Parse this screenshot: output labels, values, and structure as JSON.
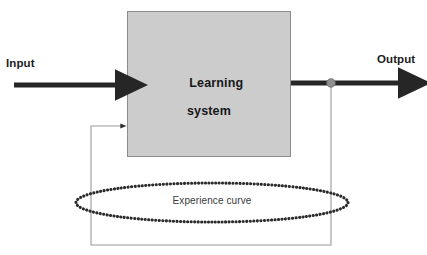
{
  "diagram": {
    "canvas": {
      "width": 427,
      "height": 255,
      "background": "#ffffff"
    },
    "colors": {
      "box_fill": "#cccccc",
      "box_stroke": "#8c8c8c",
      "arrow_dark": "#262626",
      "thin_line": "#9a9a9a",
      "node_fill": "#8f8f8f",
      "node_stroke": "#6e6e6e",
      "dotted_curve": "#2b2b2b",
      "text_dark": "#1c1c1c",
      "text_curve": "#3a3a3a"
    },
    "nodes": {
      "learning_system": {
        "label_line1": "Learning",
        "label_line2": "system",
        "x": 127,
        "y": 11,
        "width": 164,
        "height": 146
      },
      "junction": {
        "name": "output-tap-node",
        "cx": 331,
        "cy": 83,
        "r": 4.2
      }
    },
    "labels": {
      "input": "Input",
      "output": "Output",
      "experience_curve": "Experience curve"
    },
    "edges": [
      {
        "name": "input-arrow",
        "from": "Input",
        "to": "Learning system",
        "x1": 14,
        "y1": 85,
        "x2": 126,
        "y2": 85,
        "stroke_width": 5,
        "style": "solid",
        "arrowhead": "large"
      },
      {
        "name": "output-arrow",
        "from": "Learning system",
        "to": "Output",
        "x1": 291,
        "y1": 83,
        "x2": 412,
        "y2": 83,
        "stroke_width": 5,
        "style": "solid",
        "arrowhead": "large"
      },
      {
        "name": "feedback-path",
        "from": "output-tap-node",
        "to": "Learning system",
        "points": "331,83 331,245 91,245 91,126 124,126",
        "stroke_width": 1,
        "style": "solid",
        "arrowhead": "small"
      }
    ],
    "shapes": [
      {
        "name": "experience-curve-ellipse",
        "type": "ellipse",
        "cx": 212,
        "cy": 202.5,
        "rx": 136,
        "ry": 19.5,
        "style": "dotted",
        "stroke_width": 3.1,
        "dot_gap": 3.4
      }
    ]
  }
}
